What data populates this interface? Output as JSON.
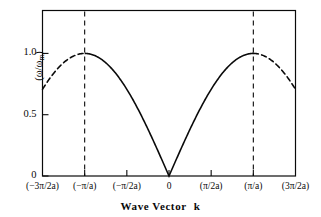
{
  "figure": {
    "background": "#ffffff",
    "ink_color": "#0a0a0a"
  },
  "chart_data": {
    "type": "line",
    "title": "",
    "subtitle": "",
    "xlabel": "Wave Vector  k",
    "xlabel_main": "Wave Vector",
    "xlabel_symbol": "k",
    "ylabel": "(ω/ωm)",
    "ylabel_numerator": "ω",
    "ylabel_denominator": "ω",
    "ylabel_denominator_sub": "m",
    "grid": false,
    "legend": "none",
    "xlim": [
      -3,
      3
    ],
    "ylim": [
      0,
      1.35
    ],
    "xtick_values": [
      -3,
      -2,
      -1,
      0,
      1,
      2,
      3
    ],
    "xtick_labels": [
      "(−3π/2a)",
      "(−π/a)",
      "(−π/2a)",
      "0",
      "(π/2a)",
      "(π/a)",
      "(3π/2a)"
    ],
    "ytick_values": [
      0,
      0.5,
      1.0
    ],
    "ytick_labels": [
      "0",
      "0.5",
      "1.0"
    ],
    "x_unit_note": "x expressed in units of π/2a",
    "equation": "omega/omega_m = |sin(k*a/2)|",
    "brillouin_zone_boundaries": [
      -2,
      2
    ],
    "zone_boundary_line_style": "dashed",
    "series": [
      {
        "name": "first Brillouin zone",
        "style": "solid",
        "x": [
          -2,
          -1.9,
          -1.8,
          -1.7,
          -1.6,
          -1.5,
          -1.4,
          -1.3,
          -1.2,
          -1.1,
          -1,
          -0.9,
          -0.8,
          -0.7,
          -0.6,
          -0.5,
          -0.4,
          -0.3,
          -0.2,
          -0.1,
          0,
          0.1,
          0.2,
          0.3,
          0.4,
          0.5,
          0.6,
          0.7,
          0.8,
          0.9,
          1,
          1.1,
          1.2,
          1.3,
          1.4,
          1.5,
          1.6,
          1.7,
          1.8,
          1.9,
          2
        ],
        "y": [
          1,
          0.9988,
          0.9951,
          0.989,
          0.9806,
          0.9698,
          0.9569,
          0.9418,
          0.9247,
          0.9057,
          0.8848,
          0.8621,
          0.8377,
          0.8116,
          0.784,
          0.7549,
          0.7245,
          0.6927,
          0.6597,
          0.6257,
          0,
          0.6257,
          0.6597,
          0.6927,
          0.7245,
          0.7549,
          0.784,
          0.8116,
          0.8377,
          0.8621,
          0.8848,
          0.9057,
          0.9247,
          0.9418,
          0.9569,
          0.9698,
          0.9806,
          0.989,
          0.9951,
          0.9988,
          1
        ],
        "note": "solid curve spans k = -pi/a to +pi/a with V-shaped minimum of 0 at k = 0"
      },
      {
        "name": "periodic extension (left)",
        "style": "dashed",
        "x": [
          -3,
          -2.9,
          -2.8,
          -2.7,
          -2.6,
          -2.5,
          -2.4,
          -2.3,
          -2.2,
          -2.1,
          -2
        ],
        "y": [
          0.7071,
          0.7485,
          0.788,
          0.8253,
          0.8603,
          0.8925,
          0.9219,
          0.9481,
          0.9709,
          0.9903,
          1
        ]
      },
      {
        "name": "periodic extension (right)",
        "style": "dashed",
        "x": [
          2,
          2.1,
          2.2,
          2.3,
          2.4,
          2.5,
          2.6,
          2.7,
          2.8,
          2.9,
          3
        ],
        "y": [
          1,
          0.9903,
          0.9709,
          0.9481,
          0.9219,
          0.8925,
          0.8603,
          0.8253,
          0.788,
          0.7485,
          0.7071
        ]
      }
    ],
    "annotations": [
      {
        "label": "peak",
        "x": -2,
        "y": 1.0
      },
      {
        "label": "peak",
        "x": 2,
        "y": 1.0
      },
      {
        "label": "minimum",
        "x": 0,
        "y": 0.0
      }
    ]
  }
}
